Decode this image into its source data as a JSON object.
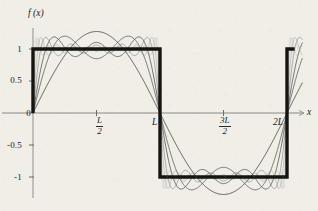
{
  "figure": {
    "background_color": "#f1eee8",
    "ink_color": "#1a1a18",
    "axis_color": "#8a8782",
    "clipped_header_text": "",
    "width": 318,
    "height": 211
  },
  "axes": {
    "y_axis_label": "f (x)",
    "x_axis_label": "x",
    "y_ticks": [
      {
        "label": "1",
        "value": 1
      },
      {
        "label": "0.5",
        "value": 0.5
      },
      {
        "label": "0",
        "value": 0
      },
      {
        "label": "-0.5",
        "value": -0.5
      },
      {
        "label": "-1",
        "value": -1
      }
    ],
    "x_ticks": [
      {
        "label": "L/2",
        "numerator": "L",
        "denominator": "2",
        "value": 0.5
      },
      {
        "label": "L",
        "numerator": "L",
        "denominator": "",
        "value": 1
      },
      {
        "label": "3L/2",
        "numerator": "3L",
        "denominator": "2",
        "value": 1.5
      },
      {
        "label": "2L",
        "numerator": "2L",
        "denominator": "",
        "value": 2
      }
    ]
  },
  "chart_data": {
    "type": "line",
    "title": "",
    "subtitle": "",
    "xlabel": "x",
    "ylabel": "f (x)",
    "xlim": [
      0,
      2.12
    ],
    "ylim": [
      -1.35,
      1.35
    ],
    "grid": false,
    "legend_position": "none",
    "annotations": [
      "Square wave f(x) drawn as thick black line",
      "Overlaid Fourier partial sums showing Gibbs phenomenon overshoot near jumps"
    ],
    "series": [
      {
        "name": "square-wave",
        "kind": "square",
        "period": 2,
        "amplitude": 1,
        "color": "#141412",
        "width": 3.4,
        "opacity": 1,
        "description": "f(x) = +1 for 0<x<L, -1 for L<x<2L"
      },
      {
        "name": "partial-sum-N1",
        "kind": "fourier",
        "harmonics": 1,
        "color": "#3b3b38",
        "width": 0.9,
        "opacity": 0.95
      },
      {
        "name": "partial-sum-N3",
        "kind": "fourier",
        "harmonics": 3,
        "color": "#4a4a46",
        "width": 0.9,
        "opacity": 0.85
      },
      {
        "name": "partial-sum-N5",
        "kind": "fourier",
        "harmonics": 5,
        "color": "#2f2f2c",
        "width": 0.85,
        "opacity": 0.8
      },
      {
        "name": "partial-sum-N9",
        "kind": "fourier",
        "harmonics": 9,
        "color": "#646460",
        "width": 0.8,
        "opacity": 0.62
      },
      {
        "name": "partial-sum-N15",
        "kind": "fourier",
        "harmonics": 15,
        "color": "#8c8c88",
        "width": 0.8,
        "opacity": 0.5
      },
      {
        "name": "partial-sum-N25",
        "kind": "fourier",
        "harmonics": 25,
        "color": "#a8a8a3",
        "width": 0.75,
        "opacity": 0.45
      },
      {
        "name": "partial-sum-N41",
        "kind": "fourier",
        "harmonics": 41,
        "color": "#bdbdb8",
        "width": 0.7,
        "opacity": 0.4
      }
    ]
  },
  "geometry": {
    "origin_px": {
      "x": 33,
      "y": 113
    },
    "x_per_unit_px": 127,
    "y_per_unit_px": 64,
    "x_axis_left_px": 2,
    "x_axis_right_px": 303
  }
}
